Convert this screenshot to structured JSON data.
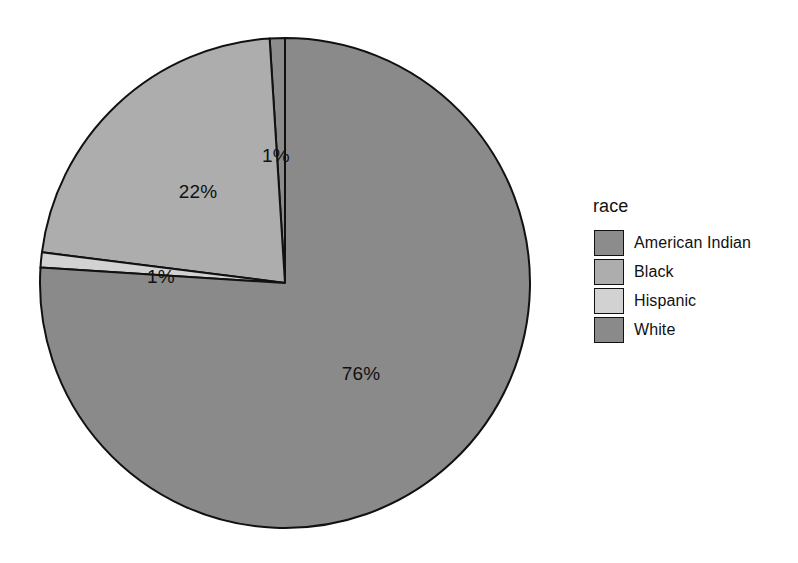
{
  "chart_data": {
    "type": "pie",
    "title": "",
    "legend_title": "race",
    "legend_position": "right",
    "categories": [
      "American Indian",
      "Black",
      "Hispanic",
      "White"
    ],
    "values": [
      1,
      22,
      1,
      76
    ],
    "value_labels": [
      "1%",
      "22%",
      "1%",
      "76%"
    ],
    "colors": [
      "#8c8c8c",
      "#adadad",
      "#d2d2d2",
      "#8a8a8a"
    ],
    "background": "#ffffff",
    "outline_color": "#111111",
    "slices": [
      {
        "name": "American Indian",
        "value": 1,
        "label": "1%",
        "color": "#8c8c8c",
        "start_deg": 356.4,
        "end_deg": 360.0,
        "label_x": 276,
        "label_y": 156
      },
      {
        "name": "Black",
        "value": 22,
        "label": "22%",
        "color": "#adadad",
        "start_deg": 277.2,
        "end_deg": 356.4,
        "label_x": 198,
        "label_y": 192
      },
      {
        "name": "Hispanic",
        "value": 1,
        "label": "1%",
        "color": "#d2d2d2",
        "start_deg": 273.6,
        "end_deg": 277.2,
        "label_x": 161,
        "label_y": 277
      },
      {
        "name": "White",
        "value": 76,
        "label": "76%",
        "color": "#8a8a8a",
        "start_deg": 0.0,
        "end_deg": 273.6,
        "label_x": 361,
        "label_y": 374
      }
    ],
    "geometry": {
      "center_x": 285,
      "center_y": 283,
      "radius": 245
    }
  },
  "legend": {
    "title": "race",
    "items": [
      {
        "label": "American Indian",
        "color": "#8c8c8c"
      },
      {
        "label": "Black",
        "color": "#adadad"
      },
      {
        "label": "Hispanic",
        "color": "#d2d2d2"
      },
      {
        "label": "White",
        "color": "#8a8a8a"
      }
    ]
  }
}
